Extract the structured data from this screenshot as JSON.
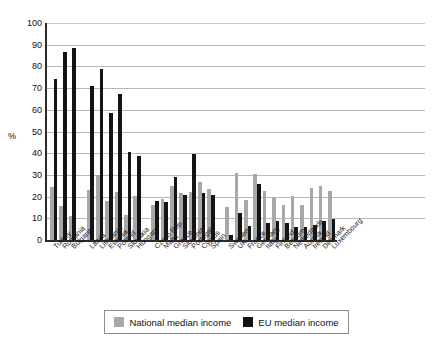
{
  "chart_data": {
    "type": "bar",
    "title": "",
    "subtitle": "",
    "xlabel": "",
    "ylabel": "%",
    "ylim": [
      0,
      100
    ],
    "yticks": [
      0,
      10,
      20,
      30,
      40,
      50,
      60,
      70,
      80,
      90,
      100
    ],
    "grid": true,
    "legend_position": "bottom",
    "categories": [
      "Turkey",
      "Romania",
      "Bulgaria",
      "Latvia",
      "Lithuania",
      "Estonia",
      "Poland",
      "Slovakia",
      "Hungary",
      "Czech Rep.",
      "Malta",
      "Greece",
      "Slovenia",
      "Portugal",
      "Cyprus",
      "Spain",
      "Sweden",
      "UK",
      "France",
      "Germany",
      "Italy",
      "Finland",
      "Belgium",
      "Netherlands",
      "Austria",
      "Ireland",
      "Denmark",
      "Luxembourg"
    ],
    "group_breaks_after": [
      "Bulgaria",
      "Hungary",
      "Spain"
    ],
    "series": [
      {
        "name": "National median income",
        "color": "#a8a8a8",
        "values": [
          24.5,
          15.5,
          11.0,
          23.0,
          29.8,
          18.0,
          22.3,
          11.3,
          20.2,
          16.0,
          18.8,
          24.8,
          21.8,
          22.0,
          26.7,
          23.3,
          15.2,
          30.8,
          18.5,
          30.3,
          22.7,
          19.5,
          16.0,
          20.3,
          16.0,
          24.0,
          25.0,
          22.8
        ]
      },
      {
        "name": "EU median income",
        "color": "#141414",
        "values": [
          74.0,
          86.5,
          88.3,
          70.8,
          78.7,
          58.4,
          67.2,
          40.5,
          38.7,
          18.2,
          17.7,
          28.9,
          20.8,
          39.5,
          21.8,
          20.8,
          2.2,
          12.3,
          6.3,
          26.0,
          8.0,
          8.8,
          8.0,
          5.8,
          5.8,
          7.0,
          8.8,
          9.8
        ]
      }
    ]
  },
  "legend": {
    "items": [
      {
        "label": "National median income",
        "color": "#a8a8a8"
      },
      {
        "label": "EU median income",
        "color": "#141414"
      }
    ]
  },
  "axis": {
    "y_title": "%"
  }
}
